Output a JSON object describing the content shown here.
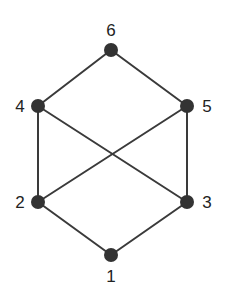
{
  "diagram": {
    "type": "hasse-diagram",
    "nodes": [
      {
        "id": "1",
        "label": "1",
        "x": 111,
        "y": 255,
        "lx": 111,
        "ly": 282,
        "anchor": "middle"
      },
      {
        "id": "2",
        "label": "2",
        "x": 38,
        "y": 202,
        "lx": 20,
        "ly": 208,
        "anchor": "middle"
      },
      {
        "id": "3",
        "label": "3",
        "x": 187,
        "y": 202,
        "lx": 207,
        "ly": 208,
        "anchor": "middle"
      },
      {
        "id": "4",
        "label": "4",
        "x": 38,
        "y": 106,
        "lx": 20,
        "ly": 112,
        "anchor": "middle"
      },
      {
        "id": "5",
        "label": "5",
        "x": 187,
        "y": 106,
        "lx": 207,
        "ly": 112,
        "anchor": "middle"
      },
      {
        "id": "6",
        "label": "6",
        "x": 111,
        "y": 50,
        "lx": 111,
        "ly": 36,
        "anchor": "middle"
      }
    ],
    "edges": [
      [
        "1",
        "2"
      ],
      [
        "1",
        "3"
      ],
      [
        "2",
        "4"
      ],
      [
        "2",
        "5"
      ],
      [
        "3",
        "4"
      ],
      [
        "3",
        "5"
      ],
      [
        "4",
        "6"
      ],
      [
        "5",
        "6"
      ]
    ],
    "colors": {
      "node": "#333333",
      "edge": "#3a3a3a",
      "label": "#222222"
    }
  }
}
